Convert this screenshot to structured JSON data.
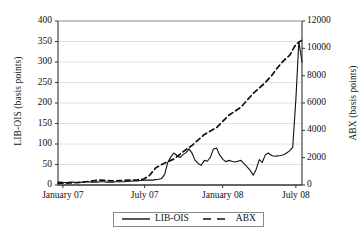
{
  "chart_data": {
    "type": "line",
    "title": "",
    "xlabel": "",
    "ylabel": "LIB-OIS (basis points)",
    "ylabel_right": "ABX (basis points)",
    "grid": true,
    "legend_position": "bottom-center",
    "xlim": [
      "January 07",
      "July 08"
    ],
    "xtick_labels": [
      "January 07",
      "July 07",
      "January 08",
      "July 08"
    ],
    "ylim": [
      0,
      400
    ],
    "ytick_labels": [
      "0",
      "50",
      "100",
      "150",
      "200",
      "250",
      "300",
      "350",
      "400"
    ],
    "ylim_right": [
      0,
      12000
    ],
    "ytick_labels_right": [
      "0",
      "2000",
      "4000",
      "6000",
      "8000",
      "10000",
      "12000"
    ],
    "series": [
      {
        "name": "LIB-OIS",
        "axis": "left",
        "style": "solid",
        "color": "#111111",
        "x": [
          0,
          0.012,
          0.025,
          0.037,
          0.05,
          0.062,
          0.075,
          0.087,
          0.1,
          0.112,
          0.125,
          0.137,
          0.15,
          0.162,
          0.175,
          0.187,
          0.2,
          0.212,
          0.225,
          0.237,
          0.25,
          0.262,
          0.275,
          0.287,
          0.3,
          0.312,
          0.325,
          0.337,
          0.35,
          0.362,
          0.375,
          0.387,
          0.4,
          0.412,
          0.425,
          0.437,
          0.45,
          0.462,
          0.475,
          0.487,
          0.5,
          0.512,
          0.525,
          0.537,
          0.55,
          0.562,
          0.575,
          0.587,
          0.6,
          0.612,
          0.625,
          0.637,
          0.65,
          0.662,
          0.675,
          0.687,
          0.7,
          0.712,
          0.725,
          0.737,
          0.75,
          0.762,
          0.775,
          0.787,
          0.8,
          0.812,
          0.825,
          0.837,
          0.85,
          0.862,
          0.875,
          0.887,
          0.9,
          0.912,
          0.925,
          0.937,
          0.95,
          0.962,
          0.975,
          0.987,
          1.0
        ],
        "values": [
          7,
          7,
          6,
          6,
          7,
          7,
          6,
          6,
          7,
          8,
          8,
          7,
          7,
          7,
          8,
          8,
          7,
          7,
          7,
          8,
          8,
          8,
          8,
          9,
          9,
          10,
          10,
          11,
          12,
          12,
          12,
          12,
          13,
          14,
          16,
          26,
          55,
          68,
          78,
          72,
          67,
          74,
          79,
          88,
          77,
          60,
          52,
          48,
          60,
          58,
          68,
          88,
          90,
          74,
          63,
          57,
          60,
          58,
          56,
          58,
          60,
          52,
          44,
          36,
          24,
          38,
          62,
          55,
          74,
          78,
          72,
          70,
          71,
          72,
          74,
          78,
          84,
          92,
          210,
          350,
          300
        ]
      },
      {
        "name": "ABX",
        "axis": "right",
        "style": "dashed",
        "color": "#111111",
        "x": [
          0,
          0.025,
          0.05,
          0.075,
          0.1,
          0.125,
          0.15,
          0.175,
          0.2,
          0.225,
          0.25,
          0.275,
          0.3,
          0.325,
          0.35,
          0.375,
          0.4,
          0.425,
          0.45,
          0.475,
          0.5,
          0.525,
          0.55,
          0.575,
          0.6,
          0.625,
          0.65,
          0.675,
          0.7,
          0.725,
          0.75,
          0.775,
          0.8,
          0.825,
          0.85,
          0.875,
          0.9,
          0.925,
          0.95,
          0.975,
          1.0
        ],
        "values": [
          130,
          140,
          150,
          170,
          200,
          260,
          320,
          360,
          330,
          300,
          320,
          340,
          360,
          380,
          420,
          700,
          1250,
          1500,
          1700,
          1900,
          2250,
          2600,
          2900,
          3300,
          3700,
          3950,
          4200,
          4650,
          5100,
          5400,
          5700,
          6200,
          6700,
          7100,
          7500,
          8000,
          8600,
          9100,
          9500,
          10300,
          10600
        ]
      }
    ]
  },
  "legend": {
    "entries": [
      {
        "label": "LIB-OIS",
        "style": "solid"
      },
      {
        "label": "ABX",
        "style": "dashed"
      }
    ]
  }
}
